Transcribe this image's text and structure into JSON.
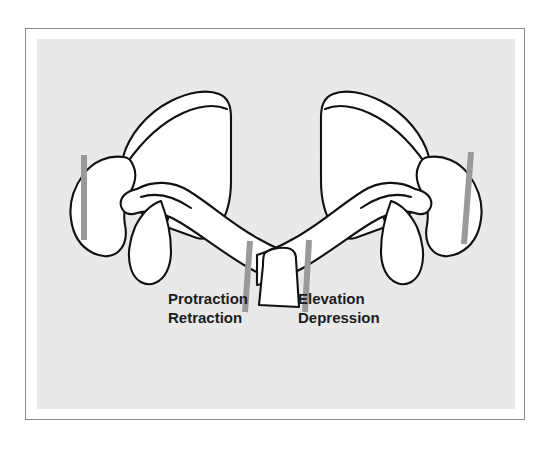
{
  "figure": {
    "kind": "anatomical-line-diagram",
    "background_color": "#e9e9e9",
    "frame_color": "#8a8a8a",
    "mat_color": "#ffffff",
    "bone_fill": "#ffffff",
    "bone_stroke": "#111111",
    "axis_bar_color": "#9a9a9a"
  },
  "labels": {
    "left": {
      "line1": "Protraction",
      "line2": "Retraction"
    },
    "right": {
      "line1": "Elevation",
      "line2": "Depression"
    }
  },
  "axis_bars": [
    {
      "name": "left-lateral-axis",
      "orientation": "vertical"
    },
    {
      "name": "right-lateral-axis",
      "orientation": "vertical-tilted"
    },
    {
      "name": "left-sternal-axis",
      "orientation": "vertical-tilted"
    },
    {
      "name": "right-sternal-axis",
      "orientation": "vertical-tilted"
    }
  ],
  "structures": [
    {
      "name": "left-scapula"
    },
    {
      "name": "left-acromion"
    },
    {
      "name": "left-clavicle"
    },
    {
      "name": "left-coracoid"
    },
    {
      "name": "right-scapula"
    },
    {
      "name": "right-acromion"
    },
    {
      "name": "right-clavicle"
    },
    {
      "name": "right-coracoid"
    },
    {
      "name": "manubrium-sterni"
    }
  ]
}
